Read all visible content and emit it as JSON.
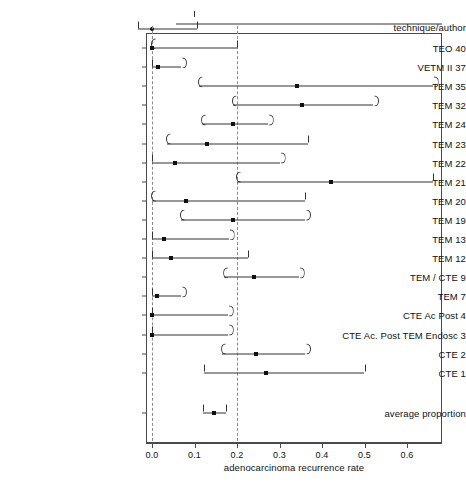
{
  "chart_data": {
    "type": "scatter",
    "subtype": "forest-plot",
    "title": "",
    "xlabel": "adenocarcinoma recurrence rate",
    "ylabel": "technique/author",
    "xlim": [
      -0.015,
      0.685
    ],
    "xticks": [
      0.0,
      0.1,
      0.2,
      0.3,
      0.4,
      0.5,
      0.6
    ],
    "xticklabels": [
      "0.0",
      "0.1",
      "0.2",
      "0.3",
      "0.4",
      "0.5",
      "0.6"
    ],
    "grid": false,
    "legend": false,
    "reference_lines": [
      {
        "x": 0.0,
        "style": "dashed"
      },
      {
        "x": 0.2,
        "style": "dashed"
      }
    ],
    "categories": [
      "TEO 40",
      "VETM II 37",
      "TEM 35",
      "TEM 32",
      "TEM 24",
      "TEM 23",
      "TEM 22",
      "TEM 21",
      "TEM 20",
      "TEM 19",
      "TEM 13",
      "TEM 12",
      "TEM / CTE 9",
      "TEM 7",
      "CTE Ac Post 4",
      "CTE Ac. Post TEM Endosc 3",
      "CTE 2",
      "CTE 1",
      "average proportion"
    ],
    "values": [
      0.0,
      0.013,
      0.34,
      0.352,
      0.19,
      0.13,
      0.055,
      0.42,
      0.08,
      0.19,
      0.028,
      0.045,
      0.24,
      0.012,
      0.0,
      0.0,
      0.245,
      0.268,
      0.145
    ],
    "ci_lower": [
      0.0,
      0.0,
      0.11,
      0.19,
      0.118,
      0.035,
      0.0,
      0.2,
      0.0,
      0.068,
      0.0,
      0.0,
      0.17,
      0.0,
      0.0,
      0.0,
      0.165,
      0.122,
      0.12
    ],
    "ci_upper": [
      0.2,
      0.068,
      0.66,
      0.52,
      0.272,
      0.368,
      0.3,
      0.66,
      0.36,
      0.36,
      0.18,
      0.226,
      0.345,
      0.068,
      0.178,
      0.178,
      0.36,
      0.5,
      0.175
    ],
    "rows": [
      {
        "label": "TEO 40",
        "value": 0.0,
        "lo": 0.0,
        "hi": 0.2,
        "lo_cap": "round",
        "hi_cap": "bar"
      },
      {
        "label": "VETM II 37",
        "value": 0.013,
        "lo": 0.0,
        "hi": 0.068,
        "lo_cap": "bar",
        "hi_cap": "round"
      },
      {
        "label": "TEM 35",
        "value": 0.34,
        "lo": 0.11,
        "hi": 0.66,
        "lo_cap": "round",
        "hi_cap": "round"
      },
      {
        "label": "TEM 32",
        "value": 0.352,
        "lo": 0.19,
        "hi": 0.52,
        "lo_cap": "round",
        "hi_cap": "round"
      },
      {
        "label": "TEM 24",
        "value": 0.19,
        "lo": 0.118,
        "hi": 0.272,
        "lo_cap": "round",
        "hi_cap": "round"
      },
      {
        "label": "TEM 23",
        "value": 0.13,
        "lo": 0.035,
        "hi": 0.368,
        "lo_cap": "round",
        "hi_cap": "bar"
      },
      {
        "label": "TEM 22",
        "value": 0.055,
        "lo": 0.0,
        "hi": 0.3,
        "lo_cap": "bar",
        "hi_cap": "round"
      },
      {
        "label": "TEM 21",
        "value": 0.42,
        "lo": 0.2,
        "hi": 0.66,
        "lo_cap": "round",
        "hi_cap": "bar"
      },
      {
        "label": "TEM 20",
        "value": 0.08,
        "lo": 0.0,
        "hi": 0.36,
        "lo_cap": "round",
        "hi_cap": "bar"
      },
      {
        "label": "TEM 19",
        "value": 0.19,
        "lo": 0.068,
        "hi": 0.36,
        "lo_cap": "round",
        "hi_cap": "round"
      },
      {
        "label": "TEM 13",
        "value": 0.028,
        "lo": 0.0,
        "hi": 0.18,
        "lo_cap": "bar",
        "hi_cap": "round"
      },
      {
        "label": "TEM 12",
        "value": 0.045,
        "lo": 0.0,
        "hi": 0.226,
        "lo_cap": "bar",
        "hi_cap": "bar"
      },
      {
        "label": "TEM / CTE 9",
        "value": 0.24,
        "lo": 0.17,
        "hi": 0.345,
        "lo_cap": "round",
        "hi_cap": "round"
      },
      {
        "label": "TEM 7",
        "value": 0.012,
        "lo": 0.0,
        "hi": 0.068,
        "lo_cap": "bar",
        "hi_cap": "round"
      },
      {
        "label": "CTE Ac Post 4",
        "value": 0.0,
        "lo": 0.0,
        "hi": 0.178,
        "lo_cap": "bar",
        "hi_cap": "round"
      },
      {
        "label": "CTE Ac. Post TEM Endosc 3",
        "value": 0.0,
        "lo": 0.0,
        "hi": 0.178,
        "lo_cap": "bar",
        "hi_cap": "round"
      },
      {
        "label": "CTE 2",
        "value": 0.245,
        "lo": 0.165,
        "hi": 0.36,
        "lo_cap": "round",
        "hi_cap": "round"
      },
      {
        "label": "CTE 1",
        "value": 0.268,
        "lo": 0.122,
        "hi": 0.5,
        "lo_cap": "bar",
        "hi_cap": "bar"
      },
      {
        "label": "average proportion",
        "value": 0.145,
        "lo": 0.12,
        "hi": 0.175,
        "lo_cap": "bar",
        "hi_cap": "bar"
      }
    ],
    "top_partial_row": {
      "label": "",
      "value": 0.0,
      "lo": 0.0,
      "hi": 0.105,
      "note": "partially clipped row at top of figure"
    },
    "annotations": []
  },
  "axis_title": {
    "y": "technique/author",
    "x": "adenocarcinoma recurrence rate"
  },
  "colors": {
    "marker": "#111111",
    "line": "#333333",
    "frame": "#4a4a4a",
    "reference": "#8a8a8a",
    "background": "#ffffff"
  }
}
